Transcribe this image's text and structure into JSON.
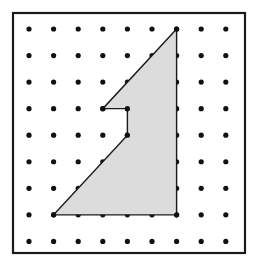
{
  "figure": {
    "name": "geoboard-polygon-figure",
    "background_color": "#ffffff"
  },
  "frame": {
    "name": "outer-frame",
    "x": 13,
    "y": 13,
    "width": 232,
    "height": 240,
    "stroke_color": "#1a1a1a",
    "stroke_width": 2.2,
    "fill_color": "#ffffff"
  },
  "grid": {
    "name": "dot-grid",
    "columns": 9,
    "rows": 9,
    "origin_x": 29,
    "origin_y": 29,
    "spacing_x": 24.6,
    "spacing_y": 26.55,
    "dot_radius": 2.6,
    "dot_color": "#111111"
  },
  "polygon": {
    "name": "shaded-polygon",
    "fill_color": "#dcdcdc",
    "stroke_color": "#1a1a1a",
    "stroke_width": 1.4,
    "vertices_grid": [
      {
        "col": 7,
        "row": 1,
        "label": "apex-top"
      },
      {
        "col": 4,
        "row": 4,
        "label": "notch-left"
      },
      {
        "col": 5,
        "row": 4,
        "label": "notch-inner-top"
      },
      {
        "col": 5,
        "row": 5,
        "label": "notch-inner-bottom"
      },
      {
        "col": 2,
        "row": 8,
        "label": "bottom-left"
      },
      {
        "col": 7,
        "row": 8,
        "label": "bottom-right"
      }
    ],
    "vertex_dot_radius": 2.6,
    "vertex_dot_color": "#111111"
  }
}
